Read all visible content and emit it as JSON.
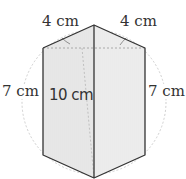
{
  "figure": {
    "labels": {
      "top_left_edge": "4 cm",
      "top_right_edge": "4 cm",
      "left_side": "7 cm",
      "right_side": "7 cm",
      "height": "10 cm"
    },
    "colors": {
      "edge": "#333333",
      "face_left": "#e6e6e6",
      "face_right": "#eeeeee",
      "top_face": "#f2f2f2",
      "dashed": "#b0b0b0",
      "circle": "#cccccc"
    }
  }
}
